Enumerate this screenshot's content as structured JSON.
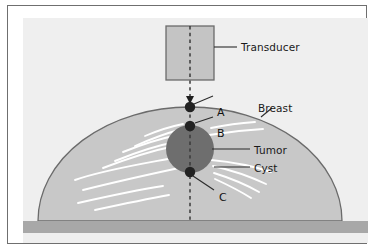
{
  "figure": {
    "title_visible": false,
    "labels": {
      "transducer": "Transducer",
      "breast": "Breast",
      "tumor": "Tumor",
      "cyst": "Cyst",
      "point_a": "A",
      "point_b": "B",
      "point_c": "C"
    },
    "colors": {
      "page_background": "#ffffff",
      "frame_border": "#6f6f6f",
      "canvas_background": "#efefef",
      "breast_fill": "#c8c8c8",
      "breast_outline": "#6b6b6b",
      "tumor_fill": "#6e6e6e",
      "transducer_fill": "#c4c4c4",
      "transducer_border": "#6b6b6b",
      "chest_wall_fill": "#a8a8a8",
      "duct_stroke": "#ffffff",
      "beam_line": "#3a3a3a",
      "point_marker": "#222222",
      "leader_line": "#2b2b2b",
      "text": "#1a1a1a"
    },
    "geometry": {
      "transducer": {
        "x": 143,
        "y": 8,
        "width": 48,
        "height": 54
      },
      "beam_axis_x": 167,
      "beam_top_y": 8,
      "beam_bottom_y": 203,
      "arrow_tip_y": 86,
      "breast_dome": {
        "center_x": 167,
        "base_y": 203,
        "rx": 152,
        "ry": 114
      },
      "tumor": {
        "center_x": 167,
        "center_y": 131,
        "radius": 24
      },
      "chest_wall": {
        "y": 203,
        "height": 12
      },
      "point_a": {
        "x": 167,
        "y": 89
      },
      "point_b": {
        "x": 167,
        "y": 108
      },
      "point_c": {
        "x": 167,
        "y": 154
      },
      "point_radius": 5.2
    },
    "annotations": [
      {
        "name": "transducer",
        "leader_from_x": 191,
        "leader_from_y": 29,
        "leader_to_x": 214,
        "leader_to_y": 29
      },
      {
        "name": "breast",
        "leader_from_x": 238,
        "leader_from_y": 99,
        "leader_to_x": 248,
        "leader_to_y": 90
      },
      {
        "name": "tumor",
        "leader_from_x": 189,
        "leader_from_y": 131,
        "leader_to_x": 227,
        "leader_to_y": 131
      },
      {
        "name": "cyst",
        "leader_from_x": 191,
        "leader_from_y": 149,
        "leader_to_x": 227,
        "leader_to_y": 149
      },
      {
        "name": "point-a",
        "leader_from_x": 171,
        "leader_from_y": 87,
        "leader_to_x": 189,
        "leader_to_y": 79
      },
      {
        "name": "point-b",
        "leader_from_x": 172,
        "leader_from_y": 106,
        "leader_to_x": 189,
        "leader_to_y": 100
      },
      {
        "name": "point-c",
        "leader_from_x": 170,
        "leader_from_y": 158,
        "leader_to_x": 190,
        "leader_to_y": 171
      }
    ],
    "ducts_description": "white curved fibrous strands radiating from the tumor through the breast tissue"
  }
}
